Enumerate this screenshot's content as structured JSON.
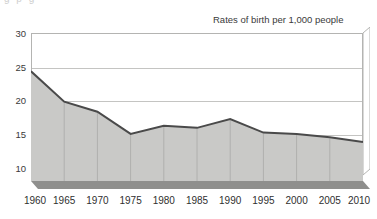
{
  "chart_data": {
    "type": "area",
    "title": "Rates of birth per 1,000 people",
    "subtitle": "",
    "xlabel": "",
    "ylabel": "",
    "categories": [
      "1960",
      "1965",
      "1970",
      "1975",
      "1980",
      "1985",
      "1990",
      "1995",
      "2000",
      "2005",
      "2010"
    ],
    "values": [
      24.3,
      19.8,
      18.3,
      15.0,
      16.2,
      15.9,
      17.2,
      15.2,
      15.0,
      14.5,
      13.8
    ],
    "series": [
      {
        "name": "Rates of birth per 1,000 people",
        "values": [
          24.3,
          19.8,
          18.3,
          15.0,
          16.2,
          15.9,
          17.2,
          15.2,
          15.0,
          14.5,
          13.8
        ]
      }
    ],
    "y_ticks": [
      30,
      25,
      20,
      15,
      10
    ],
    "ylim": [
      8.0,
      30.0
    ],
    "xlim": [
      "1960",
      "2010"
    ],
    "grid": true,
    "legend": false,
    "legend_position": "none",
    "style": "3d-area",
    "colors": {
      "area_fill": "#c9c9c7",
      "area_line": "#4a4a4a",
      "base_slab": "#8f8f8d",
      "side_wall": "#b9b9b7",
      "gridline": "#c4c4c2",
      "frame": "#b4b4b2",
      "text": "#3a3a3a",
      "background": "#ffffff"
    }
  },
  "clipped_text_above": "g  p      g",
  "annotations": []
}
